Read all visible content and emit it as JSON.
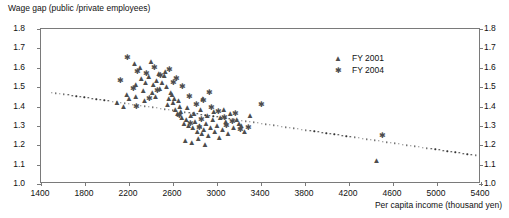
{
  "chart_data": {
    "type": "scatter",
    "title": "Wage gap (public /private employees)",
    "xlabel": "Per capita income (thousand yen)",
    "ylabel": "Wage gap (public /private employees)",
    "xlim": [
      1400,
      5400
    ],
    "ylim": [
      1.0,
      1.8
    ],
    "xticks": [
      1400,
      1800,
      2200,
      2600,
      3000,
      3400,
      3800,
      4200,
      4600,
      5000,
      5400
    ],
    "yticks": [
      "1.0",
      "1.1",
      "1.2",
      "1.3",
      "1.4",
      "1.5",
      "1.6",
      "1.7",
      "1.8"
    ],
    "grid": false,
    "legend_position": "top-right",
    "marker_color": "#4d4d4d",
    "axis_color": "#7a7a7a",
    "series": [
      {
        "name": "FY 2001",
        "marker": "triangle",
        "points": [
          [
            2180,
            1.46
          ],
          [
            2250,
            1.62
          ],
          [
            2300,
            1.6
          ],
          [
            2400,
            1.63
          ],
          [
            2310,
            1.54
          ],
          [
            2350,
            1.52
          ],
          [
            2380,
            1.55
          ],
          [
            2420,
            1.51
          ],
          [
            2450,
            1.53
          ],
          [
            2480,
            1.49
          ],
          [
            2500,
            1.52
          ],
          [
            2520,
            1.56
          ],
          [
            2540,
            1.5
          ],
          [
            2560,
            1.44
          ],
          [
            2580,
            1.47
          ],
          [
            2600,
            1.42
          ],
          [
            2620,
            1.38
          ],
          [
            2640,
            1.36
          ],
          [
            2660,
            1.4
          ],
          [
            2680,
            1.34
          ],
          [
            2700,
            1.31
          ],
          [
            2720,
            1.33
          ],
          [
            2740,
            1.3
          ],
          [
            2760,
            1.35
          ],
          [
            2780,
            1.29
          ],
          [
            2800,
            1.32
          ],
          [
            2820,
            1.27
          ],
          [
            2840,
            1.3
          ],
          [
            2860,
            1.26
          ],
          [
            2880,
            1.28
          ],
          [
            2900,
            1.31
          ],
          [
            2920,
            1.25
          ],
          [
            2940,
            1.29
          ],
          [
            2960,
            1.33
          ],
          [
            2980,
            1.27
          ],
          [
            3000,
            1.3
          ],
          [
            3020,
            1.24
          ],
          [
            3050,
            1.28
          ],
          [
            3080,
            1.32
          ],
          [
            3100,
            1.26
          ],
          [
            3150,
            1.29
          ],
          [
            3200,
            1.31
          ],
          [
            3250,
            1.27
          ],
          [
            3300,
            1.35
          ],
          [
            2090,
            1.42
          ],
          [
            2150,
            1.4
          ],
          [
            2200,
            1.44
          ],
          [
            2260,
            1.45
          ],
          [
            2330,
            1.48
          ],
          [
            2440,
            1.45
          ],
          [
            2550,
            1.41
          ],
          [
            2610,
            1.44
          ],
          [
            2670,
            1.37
          ],
          [
            2730,
            1.39
          ],
          [
            2790,
            1.36
          ],
          [
            2850,
            1.38
          ],
          [
            2910,
            1.35
          ],
          [
            2970,
            1.37
          ],
          [
            3030,
            1.34
          ],
          [
            3120,
            1.36
          ],
          [
            2470,
            1.57
          ],
          [
            2530,
            1.58
          ],
          [
            2590,
            1.46
          ],
          [
            2650,
            1.43
          ],
          [
            2710,
            1.22
          ],
          [
            2770,
            1.21
          ],
          [
            2830,
            1.23
          ],
          [
            2890,
            1.2
          ],
          [
            3180,
            1.33
          ],
          [
            3220,
            1.3
          ],
          [
            4450,
            1.12
          ],
          [
            2260,
            1.51
          ],
          [
            2340,
            1.43
          ],
          [
            2410,
            1.47
          ],
          [
            2870,
            1.44
          ],
          [
            3060,
            1.38
          ]
        ]
      },
      {
        "name": "FY 2004",
        "marker": "star",
        "points": [
          [
            2120,
            1.53
          ],
          [
            2190,
            1.65
          ],
          [
            2280,
            1.58
          ],
          [
            2360,
            1.57
          ],
          [
            2430,
            1.6
          ],
          [
            2490,
            1.56
          ],
          [
            2570,
            1.59
          ],
          [
            2630,
            1.54
          ],
          [
            2690,
            1.5
          ],
          [
            2750,
            1.45
          ],
          [
            2810,
            1.41
          ],
          [
            2880,
            1.43
          ],
          [
            2950,
            1.39
          ],
          [
            3010,
            1.37
          ],
          [
            3070,
            1.34
          ],
          [
            3140,
            1.32
          ],
          [
            3400,
            1.41
          ],
          [
            4500,
            1.25
          ],
          [
            2240,
            1.49
          ],
          [
            2460,
            1.48
          ],
          [
            2660,
            1.35
          ],
          [
            2860,
            1.33
          ],
          [
            3090,
            1.3
          ],
          [
            3210,
            1.28
          ],
          [
            2930,
            1.47
          ],
          [
            3170,
            1.36
          ],
          [
            2390,
            1.44
          ],
          [
            2600,
            1.52
          ],
          [
            2760,
            1.31
          ],
          [
            3290,
            1.29
          ],
          [
            2270,
            1.4
          ],
          [
            2840,
            1.29
          ]
        ]
      }
    ],
    "trendline": {
      "style": "dotted",
      "x0": 1500,
      "y0": 1.472,
      "x1": 5350,
      "y1": 1.148
    }
  }
}
